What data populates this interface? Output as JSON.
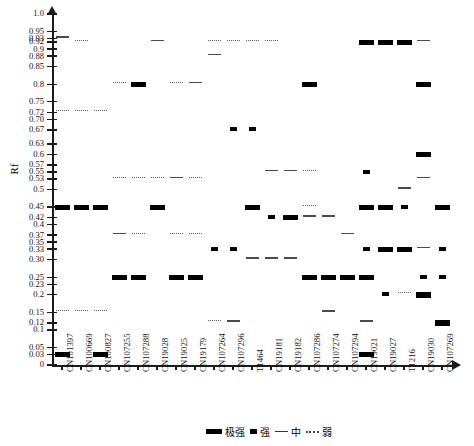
{
  "chart_data": {
    "type": "heatmap",
    "title": "",
    "xlabel": "",
    "ylabel": "Rf",
    "ylim": [
      0,
      1.0
    ],
    "grid": false,
    "legend_position": "bottom-right",
    "y_ticks": [
      {
        "label": "1.0",
        "value": 1.0
      },
      {
        "label": "0.95",
        "value": 0.95
      },
      {
        "label": "0.93",
        "value": 0.93
      },
      {
        "label": "0.92",
        "value": 0.92
      },
      {
        "label": "0.9",
        "value": 0.9
      },
      {
        "label": "0.88",
        "value": 0.88
      },
      {
        "label": "0.85",
        "value": 0.85
      },
      {
        "label": "0.8",
        "value": 0.8
      },
      {
        "label": "0.75",
        "value": 0.75
      },
      {
        "label": "0.72",
        "value": 0.72
      },
      {
        "label": "0.70",
        "value": 0.7
      },
      {
        "label": "0.67",
        "value": 0.67
      },
      {
        "label": "0.63",
        "value": 0.63
      },
      {
        "label": "0.6",
        "value": 0.6
      },
      {
        "label": "0.57",
        "value": 0.57
      },
      {
        "label": "0.55",
        "value": 0.55
      },
      {
        "label": "0.53",
        "value": 0.53
      },
      {
        "label": "0.5",
        "value": 0.5
      },
      {
        "label": "0.45",
        "value": 0.45
      },
      {
        "label": "0.42",
        "value": 0.42
      },
      {
        "label": "0.4",
        "value": 0.4
      },
      {
        "label": "0.37",
        "value": 0.37
      },
      {
        "label": "0.35",
        "value": 0.35
      },
      {
        "label": "0.33",
        "value": 0.33
      },
      {
        "label": "0.30",
        "value": 0.3
      },
      {
        "label": "0.25",
        "value": 0.25
      },
      {
        "label": "0.23",
        "value": 0.23
      },
      {
        "label": "0.2",
        "value": 0.2
      },
      {
        "label": "0.15",
        "value": 0.15
      },
      {
        "label": "0.12",
        "value": 0.12
      },
      {
        "label": "0.1",
        "value": 0.1
      },
      {
        "label": "0.05",
        "value": 0.05
      },
      {
        "label": "0.03",
        "value": 0.03
      },
      {
        "label": "0",
        "value": 0.0
      }
    ],
    "categories": [
      "CN101397",
      "CN100669",
      "CN100827",
      "CN107255",
      "CN107288",
      "CN19028",
      "CN19025",
      "CN19179",
      "CN107264",
      "CN107296",
      "T1464",
      "CN19181",
      "CN19182",
      "CN107286",
      "CN107274",
      "CN107294",
      "CN19021",
      "CN19027",
      "T1216",
      "CN19030",
      "CN107269"
    ],
    "intensity_levels": [
      {
        "key": "vstrong",
        "label": "极强"
      },
      {
        "key": "strong",
        "label": "强"
      },
      {
        "key": "med",
        "label": "中"
      },
      {
        "key": "weak",
        "label": "弱"
      }
    ],
    "bands": [
      {
        "col": 0,
        "rf": 0.93,
        "level": "med"
      },
      {
        "col": 0,
        "rf": 0.72,
        "level": "weak"
      },
      {
        "col": 0,
        "rf": 0.45,
        "level": "vstrong"
      },
      {
        "col": 0,
        "rf": 0.15,
        "level": "weak"
      },
      {
        "col": 0,
        "rf": 0.03,
        "level": "vstrong"
      },
      {
        "col": 1,
        "rf": 0.92,
        "level": "weak"
      },
      {
        "col": 1,
        "rf": 0.72,
        "level": "weak"
      },
      {
        "col": 1,
        "rf": 0.45,
        "level": "vstrong"
      },
      {
        "col": 1,
        "rf": 0.15,
        "level": "weak"
      },
      {
        "col": 2,
        "rf": 0.72,
        "level": "weak"
      },
      {
        "col": 2,
        "rf": 0.45,
        "level": "vstrong"
      },
      {
        "col": 2,
        "rf": 0.15,
        "level": "weak"
      },
      {
        "col": 2,
        "rf": 0.03,
        "level": "vstrong"
      },
      {
        "col": 3,
        "rf": 0.8,
        "level": "weak"
      },
      {
        "col": 3,
        "rf": 0.53,
        "level": "weak"
      },
      {
        "col": 3,
        "rf": 0.37,
        "level": "med"
      },
      {
        "col": 3,
        "rf": 0.25,
        "level": "vstrong"
      },
      {
        "col": 4,
        "rf": 0.8,
        "level": "vstrong"
      },
      {
        "col": 4,
        "rf": 0.53,
        "level": "weak"
      },
      {
        "col": 4,
        "rf": 0.37,
        "level": "weak"
      },
      {
        "col": 4,
        "rf": 0.25,
        "level": "vstrong"
      },
      {
        "col": 5,
        "rf": 0.92,
        "level": "med"
      },
      {
        "col": 5,
        "rf": 0.53,
        "level": "weak"
      },
      {
        "col": 5,
        "rf": 0.45,
        "level": "vstrong"
      },
      {
        "col": 6,
        "rf": 0.8,
        "level": "weak"
      },
      {
        "col": 6,
        "rf": 0.53,
        "level": "med"
      },
      {
        "col": 6,
        "rf": 0.37,
        "level": "weak"
      },
      {
        "col": 6,
        "rf": 0.25,
        "level": "vstrong"
      },
      {
        "col": 7,
        "rf": 0.8,
        "level": "med"
      },
      {
        "col": 7,
        "rf": 0.53,
        "level": "weak"
      },
      {
        "col": 7,
        "rf": 0.37,
        "level": "weak"
      },
      {
        "col": 7,
        "rf": 0.25,
        "level": "vstrong"
      },
      {
        "col": 8,
        "rf": 0.92,
        "level": "weak"
      },
      {
        "col": 8,
        "rf": 0.88,
        "level": "med"
      },
      {
        "col": 8,
        "rf": 0.33,
        "level": "strong"
      },
      {
        "col": 8,
        "rf": 0.12,
        "level": "weak"
      },
      {
        "col": 9,
        "rf": 0.92,
        "level": "weak"
      },
      {
        "col": 9,
        "rf": 0.67,
        "level": "strong"
      },
      {
        "col": 9,
        "rf": 0.33,
        "level": "strong"
      },
      {
        "col": 9,
        "rf": 0.12,
        "level": "med"
      },
      {
        "col": 10,
        "rf": 0.92,
        "level": "weak"
      },
      {
        "col": 10,
        "rf": 0.67,
        "level": "strong"
      },
      {
        "col": 10,
        "rf": 0.45,
        "level": "vstrong"
      },
      {
        "col": 10,
        "rf": 0.3,
        "level": "med"
      },
      {
        "col": 11,
        "rf": 0.92,
        "level": "weak"
      },
      {
        "col": 11,
        "rf": 0.55,
        "level": "med"
      },
      {
        "col": 11,
        "rf": 0.42,
        "level": "strong"
      },
      {
        "col": 11,
        "rf": 0.3,
        "level": "med"
      },
      {
        "col": 12,
        "rf": 0.55,
        "level": "med"
      },
      {
        "col": 12,
        "rf": 0.42,
        "level": "vstrong"
      },
      {
        "col": 12,
        "rf": 0.3,
        "level": "med"
      },
      {
        "col": 13,
        "rf": 0.8,
        "level": "vstrong"
      },
      {
        "col": 13,
        "rf": 0.55,
        "level": "weak"
      },
      {
        "col": 13,
        "rf": 0.45,
        "level": "weak"
      },
      {
        "col": 13,
        "rf": 0.42,
        "level": "med"
      },
      {
        "col": 13,
        "rf": 0.25,
        "level": "vstrong"
      },
      {
        "col": 14,
        "rf": 0.42,
        "level": "med"
      },
      {
        "col": 14,
        "rf": 0.25,
        "level": "vstrong"
      },
      {
        "col": 14,
        "rf": 0.15,
        "level": "med"
      },
      {
        "col": 15,
        "rf": 0.37,
        "level": "med"
      },
      {
        "col": 15,
        "rf": 0.25,
        "level": "vstrong"
      },
      {
        "col": 16,
        "rf": 0.92,
        "level": "vstrong"
      },
      {
        "col": 16,
        "rf": 0.55,
        "level": "strong"
      },
      {
        "col": 16,
        "rf": 0.45,
        "level": "vstrong"
      },
      {
        "col": 16,
        "rf": 0.33,
        "level": "strong"
      },
      {
        "col": 16,
        "rf": 0.25,
        "level": "vstrong"
      },
      {
        "col": 16,
        "rf": 0.12,
        "level": "med"
      },
      {
        "col": 16,
        "rf": 0.03,
        "level": "vstrong"
      },
      {
        "col": 17,
        "rf": 0.92,
        "level": "vstrong"
      },
      {
        "col": 17,
        "rf": 0.45,
        "level": "vstrong"
      },
      {
        "col": 17,
        "rf": 0.33,
        "level": "vstrong"
      },
      {
        "col": 17,
        "rf": 0.2,
        "level": "strong"
      },
      {
        "col": 18,
        "rf": 0.92,
        "level": "vstrong"
      },
      {
        "col": 18,
        "rf": 0.5,
        "level": "med"
      },
      {
        "col": 18,
        "rf": 0.45,
        "level": "strong"
      },
      {
        "col": 18,
        "rf": 0.33,
        "level": "vstrong"
      },
      {
        "col": 18,
        "rf": 0.2,
        "level": "weak"
      },
      {
        "col": 19,
        "rf": 0.92,
        "level": "med"
      },
      {
        "col": 19,
        "rf": 0.8,
        "level": "vstrong"
      },
      {
        "col": 19,
        "rf": 0.6,
        "level": "vstrong"
      },
      {
        "col": 19,
        "rf": 0.53,
        "level": "med"
      },
      {
        "col": 19,
        "rf": 0.33,
        "level": "med"
      },
      {
        "col": 19,
        "rf": 0.25,
        "level": "strong"
      },
      {
        "col": 19,
        "rf": 0.2,
        "level": "vstrong"
      },
      {
        "col": 20,
        "rf": 0.45,
        "level": "vstrong"
      },
      {
        "col": 20,
        "rf": 0.33,
        "level": "strong"
      },
      {
        "col": 20,
        "rf": 0.25,
        "level": "strong"
      },
      {
        "col": 20,
        "rf": 0.12,
        "level": "vstrong"
      }
    ]
  }
}
